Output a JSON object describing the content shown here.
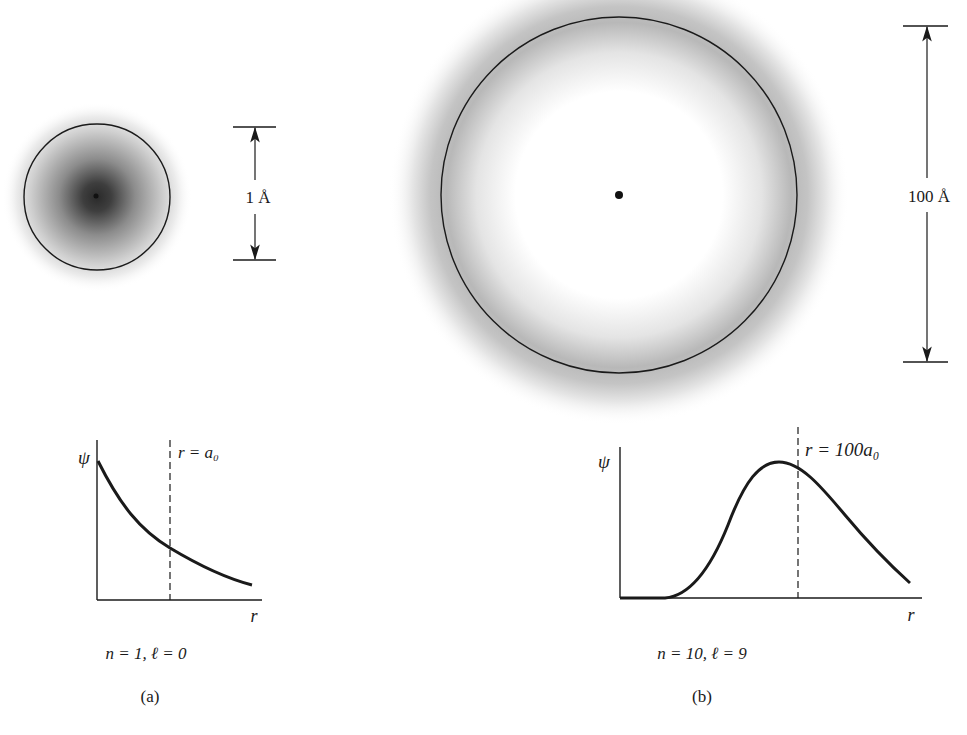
{
  "panels": [
    {
      "id": "a",
      "caption": "(a)",
      "quantum_numbers": "n = 1,  ℓ = 0",
      "scale_label": "1 Å",
      "graph": {
        "y_label": "ψ",
        "x_label": "r",
        "marker_label": "r = a₀",
        "curve_type": "exponential decay"
      }
    },
    {
      "id": "b",
      "caption": "(b)",
      "quantum_numbers": "n = 10,  ℓ = 9",
      "scale_label": "100 Å",
      "graph": {
        "y_label": "ψ",
        "x_label": "r",
        "marker_label": "r = 100a₀",
        "curve_type": "single peak near marker"
      }
    }
  ],
  "colors": {
    "ink": "#1a1a1a",
    "cloud_dark": "#303030",
    "background": "#ffffff"
  }
}
